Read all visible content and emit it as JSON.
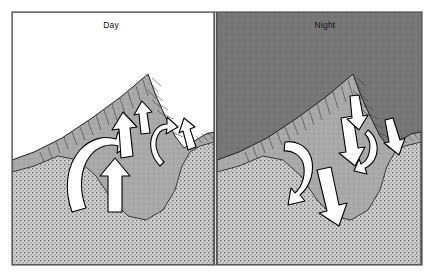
{
  "figure": {
    "type": "two-panel cross-section diagram",
    "border_color": "#555555",
    "background": "#ffffff"
  },
  "panels": [
    {
      "id": "day",
      "label": "Day",
      "label_x": 111,
      "label_y": 26,
      "sky_color": "#ffffff",
      "sky_label": "daytime-sky",
      "circulation": "anabatic / upslope valley wind",
      "arrow_direction": "upward",
      "arrows": [
        {
          "name": "arrow-left-slope-up-curved",
          "kind": "curved",
          "dir": "up"
        },
        {
          "name": "arrow-valley-center-up",
          "kind": "straight",
          "dir": "up"
        },
        {
          "name": "arrow-valley-floor-up",
          "kind": "straight",
          "dir": "up"
        },
        {
          "name": "arrow-ridge-notch-up",
          "kind": "straight",
          "dir": "up"
        },
        {
          "name": "arrow-right-slope-up-curved",
          "kind": "curved",
          "dir": "up"
        },
        {
          "name": "arrow-far-right-up",
          "kind": "straight",
          "dir": "up"
        }
      ]
    },
    {
      "id": "night",
      "label": "Night",
      "label_x": 325,
      "label_y": 26,
      "sky_color": "#767676",
      "sky_label": "nighttime-sky",
      "circulation": "katabatic / downslope drainage wind",
      "arrow_direction": "downward",
      "arrows": [
        {
          "name": "arrow-left-slope-down-curved",
          "kind": "curved",
          "dir": "down"
        },
        {
          "name": "arrow-valley-center-down",
          "kind": "straight",
          "dir": "down"
        },
        {
          "name": "arrow-valley-floor-down",
          "kind": "straight",
          "dir": "down"
        },
        {
          "name": "arrow-ridge-notch-down",
          "kind": "straight",
          "dir": "down"
        },
        {
          "name": "arrow-right-slope-down-curved",
          "kind": "curved",
          "dir": "down"
        },
        {
          "name": "arrow-far-right-down",
          "kind": "straight",
          "dir": "down"
        }
      ]
    }
  ],
  "terrain": {
    "slope_fill": "#a8a8a8",
    "slope_outline": "#222222",
    "ground_fill": "#d8d8d8",
    "ground_texture": "stipple",
    "hatch_color": "#3a3a3a",
    "arrow_fill": "#ffffff",
    "arrow_outline": "#000000"
  },
  "colors": {
    "night_sky": "#767676",
    "day_sky": "#ffffff",
    "slope": "#a8a8a8",
    "ground": "#d8d8d8",
    "frame": "#555555",
    "text": "#111111"
  }
}
